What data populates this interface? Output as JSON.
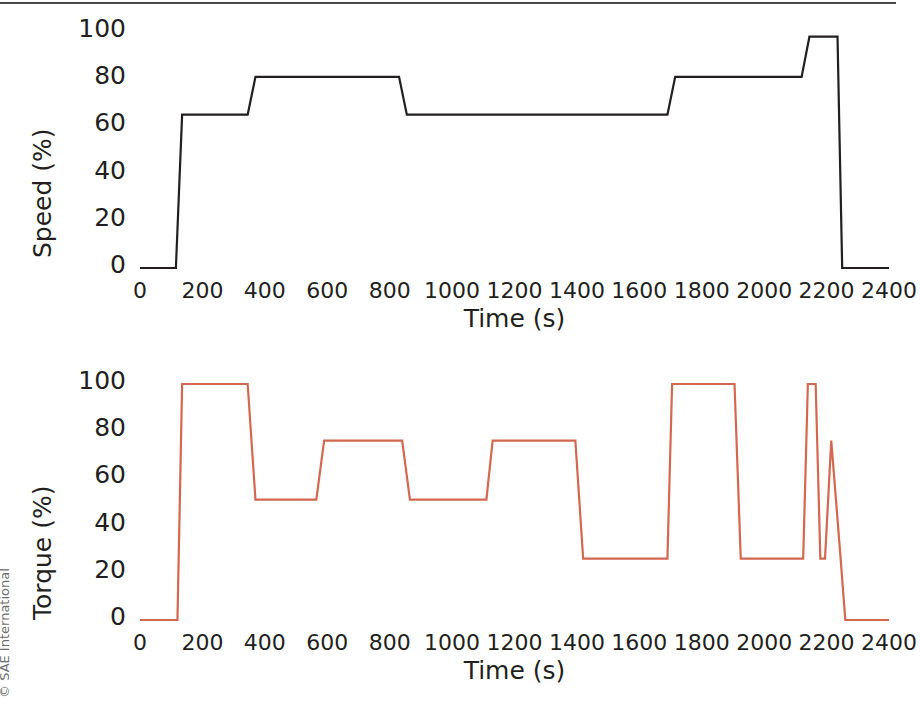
{
  "figure": {
    "copyright": "© SAE International",
    "background_color": "#ffffff",
    "rule_color": "#4a4a4a"
  },
  "chart_data": [
    {
      "id": "speed",
      "type": "line",
      "title": "",
      "xlabel": "Time (s)",
      "ylabel": "Speed (%)",
      "xlim": [
        0,
        2400
      ],
      "ylim": [
        0,
        100
      ],
      "xticks": [
        0,
        200,
        400,
        600,
        800,
        1000,
        1200,
        1400,
        1600,
        1800,
        2000,
        2200,
        2400
      ],
      "yticks": [
        0,
        20,
        40,
        60,
        80,
        100
      ],
      "grid": false,
      "line_color": "#231f20",
      "line_width": 2.2,
      "series": [
        {
          "name": "Speed (%)",
          "x": [
            0,
            115,
            135,
            345,
            370,
            830,
            855,
            1690,
            1715,
            2120,
            2145,
            2235,
            2250,
            2400
          ],
          "y": [
            0,
            0,
            65,
            65,
            81,
            81,
            65,
            65,
            81,
            81,
            98,
            98,
            0,
            0
          ]
        }
      ]
    },
    {
      "id": "torque",
      "type": "line",
      "title": "",
      "xlabel": "Time (s)",
      "ylabel": "Torque (%)",
      "xlim": [
        0,
        2400
      ],
      "ylim": [
        0,
        100
      ],
      "xticks": [
        0,
        200,
        400,
        600,
        800,
        1000,
        1200,
        1400,
        1600,
        1800,
        2000,
        2200,
        2400
      ],
      "yticks": [
        0,
        20,
        40,
        60,
        80,
        100
      ],
      "grid": false,
      "line_color": "#d4674f",
      "line_width": 2.2,
      "series": [
        {
          "name": "Torque (%)",
          "x": [
            0,
            120,
            135,
            345,
            370,
            565,
            590,
            840,
            865,
            1110,
            1130,
            1395,
            1420,
            1690,
            1705,
            1905,
            1925,
            2125,
            2140,
            2165,
            2180,
            2195,
            2215,
            2245,
            2260,
            2400
          ],
          "y": [
            0,
            0,
            100,
            100,
            51,
            51,
            76,
            76,
            51,
            51,
            76,
            76,
            26,
            26,
            100,
            100,
            26,
            26,
            100,
            100,
            26,
            26,
            76,
            26,
            0,
            0
          ]
        }
      ]
    }
  ]
}
